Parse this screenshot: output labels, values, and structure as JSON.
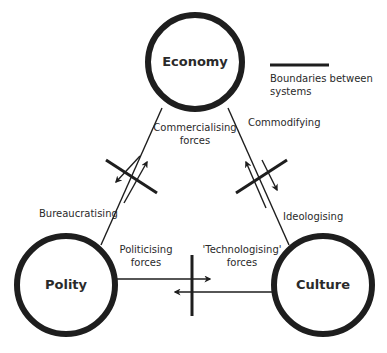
{
  "nodes": {
    "economy": {
      "label": "Economy"
    },
    "polity": {
      "label": "Polity"
    },
    "culture": {
      "label": "Culture"
    }
  },
  "legend": {
    "label_line1": "Boundaries between",
    "label_line2": "systems"
  },
  "edges": {
    "economy_polity": {
      "outer_label": "Bureaucratising",
      "inner_label_line1": "Commercialising",
      "inner_label_line2": "forces"
    },
    "economy_culture": {
      "outer_label": "Commodifying",
      "inner_label_line1": "Ideologising"
    },
    "polity_culture": {
      "left_label_line1": "Politicising",
      "left_label_line2": "forces",
      "right_label_line1": "'Technologising'",
      "right_label_line2": "forces"
    }
  },
  "colors": {
    "stroke": "#1e1e1e",
    "text": "#2a2a2a",
    "background": "#ffffff"
  }
}
